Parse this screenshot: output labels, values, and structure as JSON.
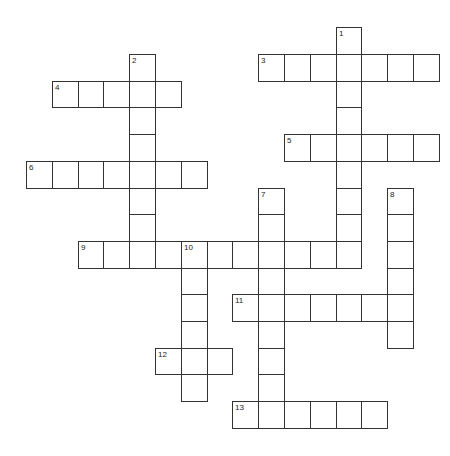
{
  "puzzle": {
    "type": "crossword",
    "grid_origin": {
      "x": 26,
      "y": 27.3
    },
    "cell_width": 25.8,
    "cell_height": 26.7,
    "colors": {
      "border": "#333333",
      "background": "#ffffff",
      "number": "#222222"
    },
    "entries": [
      {
        "number": 1,
        "direction": "down",
        "row": 0,
        "col": 12,
        "length": 9
      },
      {
        "number": 2,
        "direction": "down",
        "row": 1,
        "col": 4,
        "length": 8
      },
      {
        "number": 3,
        "direction": "across",
        "row": 1,
        "col": 9,
        "length": 7
      },
      {
        "number": 4,
        "direction": "across",
        "row": 2,
        "col": 1,
        "length": 5
      },
      {
        "number": 5,
        "direction": "across",
        "row": 4,
        "col": 10,
        "length": 6
      },
      {
        "number": 6,
        "direction": "across",
        "row": 5,
        "col": 0,
        "length": 7
      },
      {
        "number": 7,
        "direction": "down",
        "row": 6,
        "col": 9,
        "length": 9
      },
      {
        "number": 8,
        "direction": "down",
        "row": 6,
        "col": 14,
        "length": 6
      },
      {
        "number": 9,
        "direction": "across",
        "row": 8,
        "col": 2,
        "length": 11
      },
      {
        "number": 10,
        "direction": "down",
        "row": 8,
        "col": 6,
        "length": 6
      },
      {
        "number": 11,
        "direction": "across",
        "row": 10,
        "col": 8,
        "length": 7
      },
      {
        "number": 12,
        "direction": "across",
        "row": 12,
        "col": 5,
        "length": 3
      },
      {
        "number": 13,
        "direction": "across",
        "row": 14,
        "col": 8,
        "length": 6
      }
    ]
  }
}
